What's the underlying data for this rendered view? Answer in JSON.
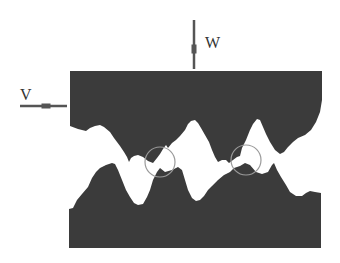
{
  "diagram": {
    "type": "rough-surface-contact",
    "labels": {
      "normal_load": "W",
      "sliding_velocity": "V"
    },
    "colors": {
      "solid": "#3b3b3b",
      "background": "#ffffff",
      "arrow": "#555555",
      "contact_circle": "#9a9a9a",
      "label": "#333333"
    },
    "upper_body": {
      "outline": [
        [
          70,
          71
        ],
        [
          322,
          71
        ],
        [
          322,
          100
        ],
        [
          320,
          112
        ],
        [
          316,
          122
        ],
        [
          311,
          130
        ],
        [
          305,
          135
        ],
        [
          298,
          138
        ],
        [
          293,
          142
        ],
        [
          288,
          147
        ],
        [
          284,
          152
        ],
        [
          280,
          154
        ],
        [
          275,
          150
        ],
        [
          270,
          142
        ],
        [
          266,
          134
        ],
        [
          263,
          127
        ],
        [
          260,
          120
        ],
        [
          257,
          119
        ],
        [
          253,
          124
        ],
        [
          250,
          130
        ],
        [
          246,
          140
        ],
        [
          242,
          148
        ],
        [
          240,
          156
        ],
        [
          237,
          157
        ],
        [
          233,
          160
        ],
        [
          229,
          163
        ],
        [
          226,
          160
        ],
        [
          222,
          160
        ],
        [
          218,
          162
        ],
        [
          215,
          157
        ],
        [
          212,
          150
        ],
        [
          209,
          142
        ],
        [
          205,
          135
        ],
        [
          201,
          128
        ],
        [
          198,
          123
        ],
        [
          195,
          120
        ],
        [
          191,
          121
        ],
        [
          188,
          124
        ],
        [
          185,
          130
        ],
        [
          180,
          136
        ],
        [
          176,
          140
        ],
        [
          172,
          143
        ],
        [
          168,
          148
        ],
        [
          166,
          145
        ],
        [
          163,
          149
        ],
        [
          160,
          154
        ],
        [
          157,
          158
        ],
        [
          153,
          163
        ],
        [
          148,
          161
        ],
        [
          143,
          157
        ],
        [
          138,
          155
        ],
        [
          134,
          156
        ],
        [
          131,
          158
        ],
        [
          129,
          162
        ],
        [
          127,
          157
        ],
        [
          124,
          152
        ],
        [
          120,
          146
        ],
        [
          114,
          138
        ],
        [
          110,
          132
        ],
        [
          104,
          127
        ],
        [
          100,
          125
        ],
        [
          95,
          126
        ],
        [
          90,
          128
        ],
        [
          86,
          131
        ],
        [
          78,
          129
        ],
        [
          70,
          126
        ]
      ]
    },
    "lower_body": {
      "outline": [
        [
          69,
          209
        ],
        [
          73,
          208
        ],
        [
          77,
          200
        ],
        [
          82,
          194
        ],
        [
          88,
          187
        ],
        [
          92,
          178
        ],
        [
          96,
          172
        ],
        [
          100,
          168
        ],
        [
          106,
          165
        ],
        [
          112,
          163
        ],
        [
          115,
          164
        ],
        [
          118,
          170
        ],
        [
          122,
          180
        ],
        [
          126,
          190
        ],
        [
          130,
          197
        ],
        [
          134,
          203
        ],
        [
          138,
          205
        ],
        [
          143,
          204
        ],
        [
          147,
          197
        ],
        [
          150,
          190
        ],
        [
          153,
          180
        ],
        [
          157,
          172
        ],
        [
          160,
          168
        ],
        [
          165,
          172
        ],
        [
          172,
          170
        ],
        [
          178,
          167
        ],
        [
          182,
          170
        ],
        [
          185,
          180
        ],
        [
          188,
          190
        ],
        [
          192,
          198
        ],
        [
          196,
          201
        ],
        [
          200,
          200
        ],
        [
          204,
          196
        ],
        [
          208,
          190
        ],
        [
          212,
          186
        ],
        [
          218,
          180
        ],
        [
          224,
          175
        ],
        [
          230,
          172
        ],
        [
          234,
          168
        ],
        [
          240,
          166
        ],
        [
          245,
          163
        ],
        [
          250,
          165
        ],
        [
          256,
          172
        ],
        [
          262,
          174
        ],
        [
          268,
          172
        ],
        [
          272,
          165
        ],
        [
          274,
          163
        ],
        [
          277,
          170
        ],
        [
          281,
          177
        ],
        [
          286,
          185
        ],
        [
          290,
          192
        ],
        [
          296,
          196
        ],
        [
          302,
          196
        ],
        [
          306,
          193
        ],
        [
          310,
          191
        ],
        [
          315,
          192
        ],
        [
          321,
          193
        ],
        [
          321,
          248
        ],
        [
          69,
          248
        ]
      ]
    },
    "contact_circles": [
      {
        "cx": 160,
        "cy": 162,
        "r": 15
      },
      {
        "cx": 246,
        "cy": 160,
        "r": 15
      }
    ],
    "arrows": {
      "load": {
        "x1": 194,
        "y1": 20,
        "x2": 194,
        "y2": 69
      },
      "velocity": {
        "x1": 20,
        "y1": 106,
        "x2": 67,
        "y2": 106
      }
    }
  }
}
